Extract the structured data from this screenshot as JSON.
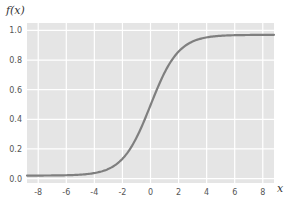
{
  "chart_data": {
    "type": "line",
    "title": "",
    "xlabel": "x",
    "ylabel": "f(x)",
    "xlim": [
      -8.8,
      8.8
    ],
    "ylim": [
      -0.03,
      1.05
    ],
    "grid": true,
    "background": "#e5e5e5",
    "grid_color": "#ffffff",
    "line_color": "#7f7f7f",
    "x_ticks": [
      -8,
      -6,
      -4,
      -2,
      0,
      2,
      4,
      6,
      8
    ],
    "x_tick_labels": [
      "-8",
      "-6",
      "-4",
      "-2",
      "0",
      "2",
      "4",
      "6",
      "8"
    ],
    "y_ticks": [
      0.0,
      0.2,
      0.4,
      0.6,
      0.8,
      1.0
    ],
    "y_tick_labels": [
      "0.0",
      "0.2",
      "0.4",
      "0.6",
      "0.8",
      "1.0"
    ],
    "series": [
      {
        "name": "f(x)",
        "function": "sigmoid",
        "x": [
          -8.8,
          -8,
          -6,
          -4,
          -3,
          -2,
          -1,
          0,
          1,
          2,
          3,
          4,
          6,
          8,
          8.8
        ],
        "values": [
          0.02,
          0.02,
          0.02,
          0.04,
          0.06,
          0.12,
          0.28,
          0.5,
          0.71,
          0.86,
          0.93,
          0.95,
          0.97,
          0.97,
          0.97
        ]
      }
    ]
  }
}
